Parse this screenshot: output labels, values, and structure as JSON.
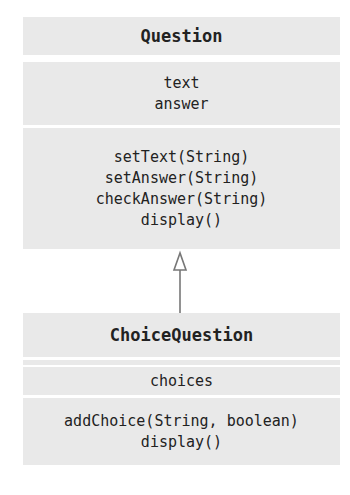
{
  "diagram": {
    "type": "UML class diagram",
    "classes": [
      {
        "name": "Question",
        "attributes": [
          "text",
          "answer"
        ],
        "methods": [
          "setText(String)",
          "setAnswer(String)",
          "checkAnswer(String)",
          "display()"
        ]
      },
      {
        "name": "ChoiceQuestion",
        "attributes": [
          "choices"
        ],
        "methods": [
          "addChoice(String, boolean)",
          "display()"
        ]
      }
    ],
    "relationships": [
      {
        "type": "inheritance",
        "from": "ChoiceQuestion",
        "to": "Question"
      }
    ],
    "colors": {
      "compartment_bg": "#e9e9e9",
      "arrow": "#777777",
      "text": "#222222"
    }
  }
}
